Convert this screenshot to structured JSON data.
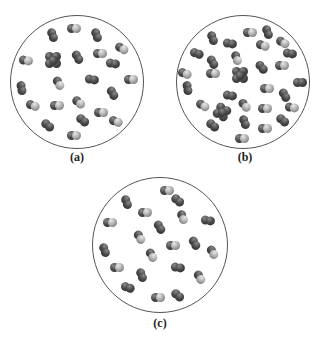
{
  "figure": {
    "panels": [
      {
        "id": "a",
        "label": "(a)",
        "cx": 77,
        "cy": 82,
        "r": 67,
        "label_x": 77,
        "label_y": 150,
        "molecules": [
          {
            "x": 53,
            "y": 35,
            "t": "d",
            "rot": 70
          },
          {
            "x": 74,
            "y": 28,
            "t": "m",
            "rot": 0
          },
          {
            "x": 97,
            "y": 35,
            "t": "d",
            "rot": 70
          },
          {
            "x": 122,
            "y": 48,
            "t": "m",
            "rot": 30
          },
          {
            "x": 26,
            "y": 60,
            "t": "m",
            "rot": 10
          },
          {
            "x": 53,
            "y": 60,
            "t": "q",
            "rot": 0
          },
          {
            "x": 78,
            "y": 57,
            "t": "d",
            "rot": 60
          },
          {
            "x": 100,
            "y": 53,
            "t": "m",
            "rot": 0
          },
          {
            "x": 113,
            "y": 63,
            "t": "d",
            "rot": 10
          },
          {
            "x": 131,
            "y": 79,
            "t": "m",
            "rot": 0
          },
          {
            "x": 22,
            "y": 88,
            "t": "d",
            "rot": 80
          },
          {
            "x": 59,
            "y": 83,
            "t": "m",
            "rot": 60
          },
          {
            "x": 92,
            "y": 79,
            "t": "d",
            "rot": 10
          },
          {
            "x": 113,
            "y": 93,
            "t": "d",
            "rot": 60
          },
          {
            "x": 33,
            "y": 105,
            "t": "m",
            "rot": 20
          },
          {
            "x": 57,
            "y": 105,
            "t": "m",
            "rot": 0
          },
          {
            "x": 79,
            "y": 102,
            "t": "m",
            "rot": 40
          },
          {
            "x": 101,
            "y": 112,
            "t": "m",
            "rot": 0
          },
          {
            "x": 83,
            "y": 120,
            "t": "d",
            "rot": 40
          },
          {
            "x": 116,
            "y": 121,
            "t": "m",
            "rot": 20
          },
          {
            "x": 48,
            "y": 125,
            "t": "d",
            "rot": 40
          },
          {
            "x": 74,
            "y": 135,
            "t": "m",
            "rot": 0
          }
        ]
      },
      {
        "id": "b",
        "label": "(b)",
        "cx": 243,
        "cy": 82,
        "r": 67,
        "label_x": 245,
        "label_y": 150,
        "molecules": [
          {
            "x": 250,
            "y": 32,
            "t": "m",
            "rot": 0
          },
          {
            "x": 268,
            "y": 32,
            "t": "d",
            "rot": 70
          },
          {
            "x": 213,
            "y": 38,
            "t": "d",
            "rot": 70
          },
          {
            "x": 230,
            "y": 43,
            "t": "d",
            "rot": 10
          },
          {
            "x": 263,
            "y": 45,
            "t": "m",
            "rot": 20
          },
          {
            "x": 283,
            "y": 42,
            "t": "m",
            "rot": 30
          },
          {
            "x": 197,
            "y": 53,
            "t": "d",
            "rot": 20
          },
          {
            "x": 290,
            "y": 53,
            "t": "d",
            "rot": 10
          },
          {
            "x": 213,
            "y": 62,
            "t": "d",
            "rot": 60
          },
          {
            "x": 237,
            "y": 58,
            "t": "m",
            "rot": 70
          },
          {
            "x": 262,
            "y": 67,
            "t": "d",
            "rot": 50
          },
          {
            "x": 282,
            "y": 65,
            "t": "m",
            "rot": 0
          },
          {
            "x": 185,
            "y": 73,
            "t": "m",
            "rot": 20
          },
          {
            "x": 213,
            "y": 73,
            "t": "m",
            "rot": 0
          },
          {
            "x": 240,
            "y": 75,
            "t": "q",
            "rot": 0
          },
          {
            "x": 300,
            "y": 82,
            "t": "d",
            "rot": 0
          },
          {
            "x": 188,
            "y": 88,
            "t": "d",
            "rot": 80
          },
          {
            "x": 267,
            "y": 88,
            "t": "m",
            "rot": 0
          },
          {
            "x": 285,
            "y": 95,
            "t": "d",
            "rot": 60
          },
          {
            "x": 230,
            "y": 95,
            "t": "d",
            "rot": 10
          },
          {
            "x": 203,
            "y": 105,
            "t": "m",
            "rot": 30
          },
          {
            "x": 222,
            "y": 112,
            "t": "q",
            "rot": 30
          },
          {
            "x": 245,
            "y": 105,
            "t": "m",
            "rot": 50
          },
          {
            "x": 265,
            "y": 108,
            "t": "m",
            "rot": 0
          },
          {
            "x": 292,
            "y": 107,
            "t": "m",
            "rot": 10
          },
          {
            "x": 283,
            "y": 120,
            "t": "d",
            "rot": 40
          },
          {
            "x": 213,
            "y": 125,
            "t": "d",
            "rot": 40
          },
          {
            "x": 245,
            "y": 122,
            "t": "d",
            "rot": 70
          },
          {
            "x": 265,
            "y": 128,
            "t": "m",
            "rot": 0
          },
          {
            "x": 242,
            "y": 138,
            "t": "m",
            "rot": 0
          }
        ]
      },
      {
        "id": "c",
        "label": "(c)",
        "cx": 160,
        "cy": 245,
        "r": 68,
        "label_x": 160,
        "label_y": 316,
        "molecules": [
          {
            "x": 167,
            "y": 190,
            "t": "m",
            "rot": 0
          },
          {
            "x": 127,
            "y": 202,
            "t": "d",
            "rot": 70
          },
          {
            "x": 178,
            "y": 200,
            "t": "d",
            "rot": 40
          },
          {
            "x": 145,
            "y": 212,
            "t": "m",
            "rot": 0
          },
          {
            "x": 183,
            "y": 217,
            "t": "m",
            "rot": 70
          },
          {
            "x": 110,
            "y": 222,
            "t": "m",
            "rot": 0
          },
          {
            "x": 208,
            "y": 220,
            "t": "d",
            "rot": 10
          },
          {
            "x": 160,
            "y": 227,
            "t": "d",
            "rot": 60
          },
          {
            "x": 140,
            "y": 237,
            "t": "m",
            "rot": 60
          },
          {
            "x": 105,
            "y": 250,
            "t": "d",
            "rot": 70
          },
          {
            "x": 173,
            "y": 245,
            "t": "m",
            "rot": 0
          },
          {
            "x": 195,
            "y": 243,
            "t": "d",
            "rot": 60
          },
          {
            "x": 213,
            "y": 252,
            "t": "m",
            "rot": 60
          },
          {
            "x": 152,
            "y": 255,
            "t": "m",
            "rot": 60
          },
          {
            "x": 117,
            "y": 267,
            "t": "m",
            "rot": 0
          },
          {
            "x": 178,
            "y": 267,
            "t": "d",
            "rot": 10
          },
          {
            "x": 142,
            "y": 275,
            "t": "d",
            "rot": 70
          },
          {
            "x": 200,
            "y": 277,
            "t": "m",
            "rot": 60
          },
          {
            "x": 128,
            "y": 287,
            "t": "d",
            "rot": 20
          },
          {
            "x": 158,
            "y": 297,
            "t": "m",
            "rot": 0
          },
          {
            "x": 178,
            "y": 295,
            "t": "d",
            "rot": 40
          }
        ]
      }
    ]
  }
}
